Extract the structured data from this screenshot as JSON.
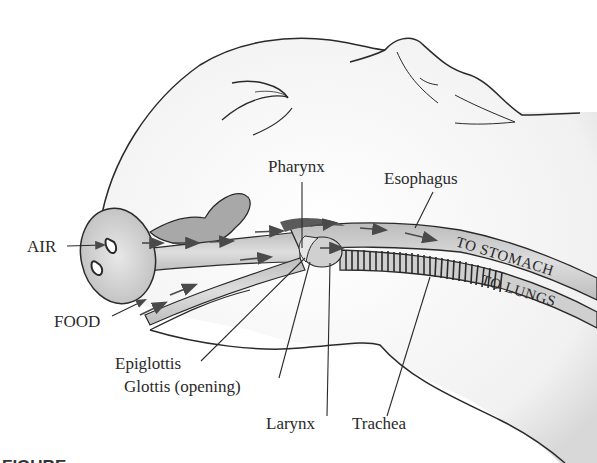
{
  "figure": {
    "labels": {
      "air": "AIR",
      "food": "FOOD",
      "pharynx": "Pharynx",
      "esophagus": "Esophagus",
      "epiglottis": "Epiglottis",
      "glottis": "Glottis (opening)",
      "larynx": "Larynx",
      "trachea": "Trachea",
      "to_stomach": "TO STOMACH",
      "to_lungs": "TO LUNGS"
    },
    "caption_partial": "FIGURE",
    "colors": {
      "outline": "#2a2a2a",
      "skin": "#f4f4f4",
      "tube": "#d4d4d4",
      "tube_dark": "#8a8a8a",
      "arrow": "#555555",
      "background": "#ffffff"
    }
  }
}
